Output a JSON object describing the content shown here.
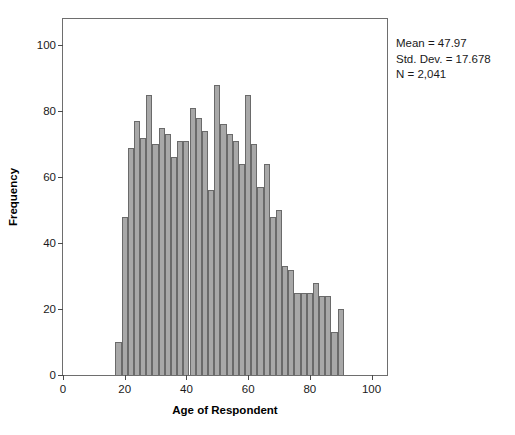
{
  "chart_data": {
    "type": "bar",
    "title": "",
    "subtitle": "",
    "xlabel": "Age of Respondent",
    "ylabel": "Frequency",
    "xlim": [
      0,
      105
    ],
    "ylim": [
      0,
      108
    ],
    "grid": false,
    "legend": null,
    "bin_width": 2,
    "x_ticks": [
      0,
      20,
      40,
      60,
      80,
      100
    ],
    "y_ticks": [
      0,
      20,
      40,
      60,
      80,
      100
    ],
    "bar_color": "#a8a8a8",
    "bar_edge_color": "#6a6a6a",
    "categories": [
      18,
      20,
      22,
      24,
      26,
      28,
      30,
      32,
      34,
      36,
      38,
      40,
      42,
      44,
      46,
      48,
      50,
      52,
      54,
      56,
      58,
      60,
      62,
      64,
      66,
      68,
      70,
      72,
      74,
      76,
      78,
      80,
      82,
      84,
      86,
      88,
      90
    ],
    "values": [
      10,
      48,
      69,
      77,
      72,
      85,
      70,
      75,
      73,
      66,
      71,
      71,
      81,
      78,
      74,
      56,
      88,
      76,
      73,
      71,
      64,
      85,
      70,
      57,
      64,
      48,
      50,
      33,
      32,
      25,
      25,
      25,
      28,
      24,
      24,
      13,
      20
    ],
    "annotations": [
      "Mean = 47.97",
      "Std. Dev. = 17.678",
      "N = 2,041"
    ]
  },
  "stats": {
    "mean_line": "Mean = 47.97",
    "sd_line": "Std. Dev. = 17.678",
    "n_line": "N = 2,041"
  }
}
